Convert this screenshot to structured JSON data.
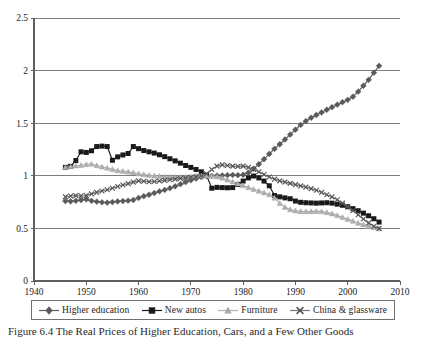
{
  "figure": {
    "caption": "Figure 6.4  The Real Prices of Higher Education, Cars, and a Few Other Goods"
  },
  "legend": {
    "entries": [
      {
        "label": "Higher education",
        "marker": "diamond",
        "color": "#5a5a5a",
        "icon": "diamond-marker-icon"
      },
      {
        "label": "New autos",
        "marker": "square",
        "color": "#1a1a1a",
        "icon": "square-marker-icon"
      },
      {
        "label": "Furniture",
        "marker": "triangle",
        "color": "#b0b0b0",
        "icon": "triangle-marker-icon"
      },
      {
        "label": "China & glassware",
        "marker": "x",
        "color": "#7a7a7a",
        "icon": "x-marker-icon"
      }
    ]
  },
  "chart_data": {
    "type": "line",
    "title": "",
    "subtitle": "",
    "xlabel": "",
    "ylabel": "",
    "xlim": [
      1940,
      2010
    ],
    "ylim": [
      0,
      2.5
    ],
    "xticks": [
      1940,
      1950,
      1960,
      1970,
      1980,
      1990,
      2000,
      2010
    ],
    "yticks": [
      0,
      0.5,
      1,
      1.5,
      2,
      2.5
    ],
    "xtick_labels": [
      "1940",
      "1950",
      "1960",
      "1970",
      "1980",
      "1990",
      "2000",
      "2010"
    ],
    "ytick_labels": [
      "0",
      "0.5",
      "1",
      "1.5",
      "2",
      "2.5"
    ],
    "grid": "horizontal",
    "legend_position": "bottom",
    "x": [
      1946,
      1947,
      1948,
      1949,
      1950,
      1951,
      1952,
      1953,
      1954,
      1955,
      1956,
      1957,
      1958,
      1959,
      1960,
      1961,
      1962,
      1963,
      1964,
      1965,
      1966,
      1967,
      1968,
      1969,
      1970,
      1971,
      1972,
      1973,
      1974,
      1975,
      1976,
      1977,
      1978,
      1979,
      1980,
      1981,
      1982,
      1983,
      1984,
      1985,
      1986,
      1987,
      1988,
      1989,
      1990,
      1991,
      1992,
      1993,
      1994,
      1995,
      1996,
      1997,
      1998,
      1999,
      2000,
      2001,
      2002,
      2003,
      2004,
      2005,
      2006
    ],
    "series": [
      {
        "name": "Higher education",
        "marker": "diamond",
        "color": "#5a5a5a",
        "values": [
          0.76,
          0.757,
          0.762,
          0.77,
          0.776,
          0.762,
          0.754,
          0.748,
          0.745,
          0.75,
          0.756,
          0.76,
          0.764,
          0.77,
          0.79,
          0.806,
          0.82,
          0.836,
          0.852,
          0.866,
          0.882,
          0.9,
          0.92,
          0.94,
          0.958,
          0.974,
          0.988,
          0.996,
          1.0,
          1.002,
          1.004,
          1.006,
          1.008,
          1.006,
          1.01,
          1.03,
          1.068,
          1.11,
          1.158,
          1.208,
          1.256,
          1.3,
          1.345,
          1.392,
          1.438,
          1.484,
          1.52,
          1.552,
          1.578,
          1.602,
          1.628,
          1.652,
          1.676,
          1.7,
          1.722,
          1.752,
          1.8,
          1.856,
          1.912,
          1.98,
          2.045
        ]
      },
      {
        "name": "New autos",
        "marker": "square",
        "color": "#1a1a1a",
        "values": [
          1.08,
          1.09,
          1.145,
          1.228,
          1.222,
          1.238,
          1.278,
          1.282,
          1.278,
          1.148,
          1.18,
          1.198,
          1.212,
          1.278,
          1.258,
          1.24,
          1.228,
          1.216,
          1.2,
          1.182,
          1.162,
          1.142,
          1.12,
          1.098,
          1.08,
          1.06,
          1.038,
          1.006,
          0.882,
          0.89,
          0.888,
          0.886,
          0.888,
          0.918,
          0.95,
          0.98,
          0.998,
          0.98,
          0.95,
          0.905,
          0.812,
          0.8,
          0.79,
          0.782,
          0.76,
          0.748,
          0.744,
          0.742,
          0.74,
          0.742,
          0.744,
          0.74,
          0.73,
          0.72,
          0.706,
          0.688,
          0.668,
          0.645,
          0.62,
          0.592,
          0.56
        ]
      },
      {
        "name": "Furniture",
        "marker": "triangle",
        "color": "#b0b0b0",
        "values": [
          1.082,
          1.088,
          1.096,
          1.1,
          1.108,
          1.112,
          1.098,
          1.086,
          1.074,
          1.062,
          1.05,
          1.044,
          1.038,
          1.03,
          1.02,
          1.012,
          1.006,
          1.0,
          0.996,
          0.992,
          0.99,
          0.988,
          0.988,
          0.99,
          0.994,
          0.998,
          1.0,
          1.0,
          0.998,
          0.992,
          0.98,
          0.962,
          0.944,
          0.926,
          0.908,
          0.89,
          0.872,
          0.856,
          0.84,
          0.822,
          0.79,
          0.74,
          0.702,
          0.68,
          0.668,
          0.662,
          0.66,
          0.662,
          0.664,
          0.66,
          0.652,
          0.64,
          0.624,
          0.606,
          0.588,
          0.57,
          0.552,
          0.536,
          0.52,
          0.508,
          0.498
        ]
      },
      {
        "name": "China & glassware",
        "marker": "x",
        "color": "#7a7a7a",
        "values": [
          0.8,
          0.808,
          0.812,
          0.81,
          0.812,
          0.828,
          0.842,
          0.856,
          0.868,
          0.882,
          0.898,
          0.912,
          0.926,
          0.94,
          0.952,
          0.948,
          0.944,
          0.946,
          0.95,
          0.956,
          0.962,
          0.968,
          0.974,
          0.98,
          0.986,
          0.992,
          1.0,
          1.02,
          1.06,
          1.092,
          1.104,
          1.098,
          1.092,
          1.09,
          1.092,
          1.08,
          1.06,
          1.038,
          1.012,
          0.988,
          0.968,
          0.952,
          0.94,
          0.928,
          0.916,
          0.904,
          0.892,
          0.878,
          0.862,
          0.842,
          0.82,
          0.8,
          0.772,
          0.74,
          0.706,
          0.668,
          0.63,
          0.59,
          0.552,
          0.52,
          0.5
        ]
      }
    ]
  }
}
